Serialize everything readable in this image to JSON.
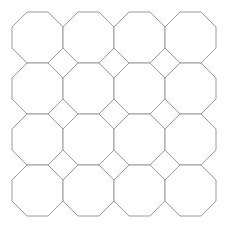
{
  "canvas": {
    "width": 227,
    "height": 231,
    "background_color": "#ffffff",
    "title": "Octagon Tiling"
  },
  "figure": {
    "type": "geometric-tiling",
    "shape_name": "octagon",
    "shape_count": 16,
    "rows": 4,
    "columns": 4,
    "stroke_color": "#9a9a9a",
    "stroke_width": 1,
    "fill_color": "#ffffff",
    "origin_x": 12,
    "origin_y": 12,
    "cell_size": 51,
    "pitch_x": 51,
    "pitch_y": 51,
    "chamfer": 15,
    "gap_shape": "diamond"
  },
  "shapes": [
    {
      "id": "octagon-r1-c1",
      "row": 1,
      "col": 1,
      "x": 12,
      "y": 12
    },
    {
      "id": "octagon-r1-c2",
      "row": 1,
      "col": 2,
      "x": 63,
      "y": 12
    },
    {
      "id": "octagon-r1-c3",
      "row": 1,
      "col": 3,
      "x": 114,
      "y": 12
    },
    {
      "id": "octagon-r1-c4",
      "row": 1,
      "col": 4,
      "x": 165,
      "y": 12
    },
    {
      "id": "octagon-r2-c1",
      "row": 2,
      "col": 1,
      "x": 12,
      "y": 63
    },
    {
      "id": "octagon-r2-c2",
      "row": 2,
      "col": 2,
      "x": 63,
      "y": 63
    },
    {
      "id": "octagon-r2-c3",
      "row": 2,
      "col": 3,
      "x": 114,
      "y": 63
    },
    {
      "id": "octagon-r2-c4",
      "row": 2,
      "col": 4,
      "x": 165,
      "y": 63
    },
    {
      "id": "octagon-r3-c1",
      "row": 3,
      "col": 1,
      "x": 12,
      "y": 114
    },
    {
      "id": "octagon-r3-c2",
      "row": 3,
      "col": 2,
      "x": 63,
      "y": 114
    },
    {
      "id": "octagon-r3-c3",
      "row": 3,
      "col": 3,
      "x": 114,
      "y": 114
    },
    {
      "id": "octagon-r3-c4",
      "row": 3,
      "col": 4,
      "x": 165,
      "y": 114
    },
    {
      "id": "octagon-r4-c1",
      "row": 4,
      "col": 1,
      "x": 12,
      "y": 165
    },
    {
      "id": "octagon-r4-c2",
      "row": 4,
      "col": 2,
      "x": 63,
      "y": 165
    },
    {
      "id": "octagon-r4-c3",
      "row": 4,
      "col": 3,
      "x": 114,
      "y": 165
    },
    {
      "id": "octagon-r4-c4",
      "row": 4,
      "col": 4,
      "x": 165,
      "y": 165
    }
  ]
}
